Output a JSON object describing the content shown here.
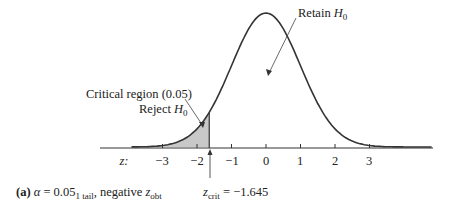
{
  "chart_data": {
    "type": "area",
    "title": "",
    "subtitle": "(a) α = 0.05 1 tail, negative z_obt",
    "xlabel": "z",
    "ylabel": "",
    "x_ticks": [
      -3,
      -2,
      -1,
      0,
      1,
      2,
      3
    ],
    "xlim": [
      -3.9,
      4.8
    ],
    "distribution": "standard normal",
    "critical_value": -1.645,
    "shaded_region": {
      "from": -3.9,
      "to": -1.645,
      "area": 0.05,
      "color": "#c8c8c8"
    },
    "annotations": [
      {
        "text": "Critical region (0.05)",
        "line2": "Reject H0",
        "points_to": "shaded left tail"
      },
      {
        "text": "Retain H0",
        "points_to": "body of curve"
      },
      {
        "text": "z_crit = −1.645",
        "points_to": "z = -1.645"
      }
    ],
    "grid": false,
    "legend": "none"
  },
  "labels": {
    "z_axis": "z:",
    "ticks": [
      "−3",
      "−2",
      "−1",
      "0",
      "1",
      "2",
      "3"
    ],
    "critical_region": "Critical region (0.05)",
    "reject": "Reject ",
    "retain": "Retain ",
    "h": "H",
    "h_sub": "0",
    "caption_a": "(a)",
    "caption_alpha": "α",
    "caption_eq": " = 0.05",
    "caption_sub": "1 tail",
    "caption_rest": ", negative ",
    "caption_z": "z",
    "caption_zsub": "obt",
    "zcrit_z": "z",
    "zcrit_sub": "crit",
    "zcrit_val": " = −1.645"
  }
}
